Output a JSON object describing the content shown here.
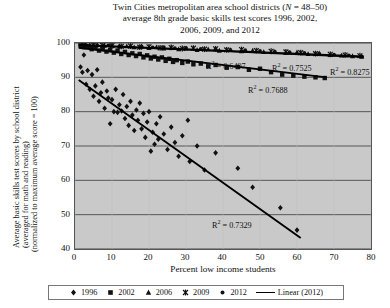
{
  "title": {
    "line1_a": "Twin Cities metropolitan area school districts (",
    "line1_italic": "N",
    "line1_b": " = 48–50)",
    "line2": "average 8th grade basic skills test scores 1996, 2002,",
    "line3": "2006, 2009, and 2012"
  },
  "axes": {
    "y_title_line1": "Average basic skills test scores by school district",
    "y_title_line2": "(averaged for math and reading)",
    "y_title_line3": "(normalized to maximum average score = 100)",
    "x_title": "Percent low income students",
    "y_ticks": [
      "100",
      "90",
      "80",
      "70",
      "60",
      "50",
      "40"
    ],
    "x_ticks": [
      "0",
      "10",
      "20",
      "30",
      "40",
      "50",
      "60",
      "70",
      "80"
    ]
  },
  "annotations": [
    {
      "name": "r2-2006",
      "text_prefix": "R",
      "text_sup": "2",
      "text_suffix": " = 0.6497",
      "value": 0.6497
    },
    {
      "name": "r2-2009",
      "text_prefix": "R",
      "text_sup": "2",
      "text_suffix": " = 0.7525",
      "value": 0.7525
    },
    {
      "name": "r2-2012",
      "text_prefix": "R",
      "text_sup": "2",
      "text_suffix": " = 0.8275",
      "value": 0.8275
    },
    {
      "name": "r2-2002",
      "text_prefix": "R",
      "text_sup": "2",
      "text_suffix": " = 0.7688",
      "value": 0.7688
    },
    {
      "name": "r2-1996",
      "text_prefix": "R",
      "text_sup": "2",
      "text_suffix": " = 0.7329",
      "value": 0.7329
    }
  ],
  "legend": {
    "items": [
      {
        "label": "1996",
        "marker": "diamond"
      },
      {
        "label": "2002",
        "marker": "square"
      },
      {
        "label": "2006",
        "marker": "triangle"
      },
      {
        "label": "2009",
        "marker": "cross"
      },
      {
        "label": "2012",
        "marker": "dot"
      },
      {
        "label": "Linear (2012)",
        "marker": "line"
      }
    ]
  },
  "chart_data": {
    "type": "scatter",
    "xlabel": "Percent low income students",
    "ylabel": "Average basic skills test scores by school district (averaged for math and reading) (normalized to maximum average score = 100)",
    "xlim": [
      0,
      80
    ],
    "ylim": [
      40,
      100
    ],
    "grid": "horizontal",
    "legend_position": "bottom",
    "series": [
      {
        "name": "1996",
        "marker": "diamond",
        "color": "#111111",
        "r_squared": 0.7329,
        "trendline": {
          "x0": 1,
          "y0": 89.2,
          "x1": 61,
          "y1": 43.2
        },
        "points": [
          [
            1.5,
            93.0
          ],
          [
            2.0,
            91.5
          ],
          [
            2.4,
            96.5
          ],
          [
            3.0,
            88.0
          ],
          [
            3.4,
            92.0
          ],
          [
            4.0,
            86.5
          ],
          [
            4.6,
            90.8
          ],
          [
            5.0,
            84.5
          ],
          [
            5.5,
            87.5
          ],
          [
            6.0,
            92.2
          ],
          [
            6.5,
            83.0
          ],
          [
            7.0,
            85.5
          ],
          [
            7.4,
            88.6
          ],
          [
            8.0,
            81.0
          ],
          [
            8.6,
            86.0
          ],
          [
            9.0,
            84.0
          ],
          [
            9.5,
            76.5
          ],
          [
            10.0,
            83.5
          ],
          [
            10.5,
            80.0
          ],
          [
            11.0,
            86.5
          ],
          [
            11.5,
            79.8
          ],
          [
            12.0,
            82.0
          ],
          [
            12.6,
            80.2
          ],
          [
            13.0,
            85.0
          ],
          [
            13.5,
            78.0
          ],
          [
            14.0,
            81.5
          ],
          [
            14.5,
            76.0
          ],
          [
            15.0,
            83.0
          ],
          [
            15.5,
            79.0
          ],
          [
            16.0,
            74.5
          ],
          [
            16.6,
            80.5
          ],
          [
            17.0,
            77.5
          ],
          [
            17.5,
            82.5
          ],
          [
            18.0,
            75.0
          ],
          [
            18.5,
            79.5
          ],
          [
            19.0,
            72.5
          ],
          [
            19.5,
            77.0
          ],
          [
            20.0,
            80.0
          ],
          [
            20.5,
            68.5
          ],
          [
            21.0,
            74.0
          ],
          [
            21.5,
            70.5
          ],
          [
            22.0,
            76.5
          ],
          [
            22.5,
            72.0
          ],
          [
            23.0,
            78.5
          ],
          [
            24.0,
            73.5
          ],
          [
            25.0,
            69.0
          ],
          [
            26.0,
            75.5
          ],
          [
            27.0,
            71.0
          ],
          [
            28.0,
            67.0
          ],
          [
            29.0,
            73.0
          ],
          [
            30.5,
            77.5
          ],
          [
            31.0,
            65.5
          ],
          [
            33.0,
            70.0
          ],
          [
            35.0,
            63.0
          ],
          [
            38.0,
            68.0
          ],
          [
            44.0,
            63.5
          ],
          [
            48.0,
            58.0
          ],
          [
            55.5,
            52.0
          ],
          [
            60.0,
            45.5
          ]
        ]
      },
      {
        "name": "2002",
        "marker": "square",
        "color": "#111111",
        "r_squared": 0.7688,
        "trendline": {
          "x0": 1,
          "y0": 98.6,
          "x1": 68,
          "y1": 90.0
        },
        "points": [
          [
            1.5,
            99.3
          ],
          [
            2.5,
            98.8
          ],
          [
            3.5,
            99.0
          ],
          [
            4.5,
            98.2
          ],
          [
            5.5,
            98.6
          ],
          [
            6.5,
            97.8
          ],
          [
            7.5,
            98.4
          ],
          [
            8.5,
            97.5
          ],
          [
            9.5,
            98.0
          ],
          [
            10.5,
            97.2
          ],
          [
            11.5,
            97.8
          ],
          [
            12.5,
            96.8
          ],
          [
            13.5,
            97.4
          ],
          [
            14.5,
            96.5
          ],
          [
            15.5,
            97.0
          ],
          [
            16.5,
            96.2
          ],
          [
            17.5,
            96.8
          ],
          [
            18.5,
            95.8
          ],
          [
            19.5,
            96.4
          ],
          [
            20.5,
            95.5
          ],
          [
            21.5,
            96.0
          ],
          [
            22.5,
            95.2
          ],
          [
            23.5,
            95.8
          ],
          [
            24.5,
            94.8
          ],
          [
            25.5,
            95.4
          ],
          [
            26.5,
            94.5
          ],
          [
            27.5,
            95.0
          ],
          [
            29.0,
            94.2
          ],
          [
            30.5,
            94.6
          ],
          [
            32.0,
            93.8
          ],
          [
            34.0,
            94.0
          ],
          [
            36.0,
            93.2
          ],
          [
            38.0,
            93.6
          ],
          [
            41.0,
            92.8
          ],
          [
            44.0,
            93.0
          ],
          [
            47.0,
            92.2
          ],
          [
            50.0,
            92.5
          ],
          [
            53.0,
            91.5
          ],
          [
            56.0,
            90.8
          ],
          [
            59.0,
            90.5
          ],
          [
            62.0,
            90.2
          ],
          [
            65.0,
            90.0
          ],
          [
            67.5,
            89.8
          ]
        ]
      },
      {
        "name": "2006",
        "marker": "triangle",
        "color": "#111111",
        "r_squared": 0.6497,
        "trendline": {
          "x0": 1,
          "y0": 99.4,
          "x1": 78,
          "y1": 95.8
        },
        "points": [
          [
            2.0,
            99.6
          ],
          [
            4.0,
            99.4
          ],
          [
            6.0,
            99.5
          ],
          [
            8.0,
            99.2
          ],
          [
            10.0,
            99.3
          ],
          [
            12.0,
            99.0
          ],
          [
            14.0,
            99.1
          ],
          [
            16.0,
            98.8
          ],
          [
            18.0,
            99.0
          ],
          [
            20.0,
            98.6
          ],
          [
            22.0,
            98.8
          ],
          [
            24.0,
            98.4
          ],
          [
            26.0,
            98.6
          ],
          [
            28.0,
            98.2
          ],
          [
            30.0,
            98.4
          ],
          [
            33.0,
            98.0
          ],
          [
            36.0,
            98.2
          ],
          [
            39.0,
            97.8
          ],
          [
            42.0,
            98.0
          ],
          [
            45.0,
            97.6
          ],
          [
            48.0,
            97.8
          ],
          [
            51.0,
            97.4
          ],
          [
            54.0,
            97.5
          ],
          [
            57.0,
            97.2
          ],
          [
            60.0,
            97.3
          ],
          [
            63.0,
            96.8
          ],
          [
            66.0,
            97.0
          ],
          [
            69.0,
            96.5
          ],
          [
            72.0,
            96.4
          ],
          [
            75.0,
            96.2
          ],
          [
            77.5,
            96.0
          ]
        ]
      },
      {
        "name": "2009",
        "marker": "cross",
        "color": "#111111",
        "r_squared": 0.7525,
        "trendline": {
          "x0": 1,
          "y0": 99.5,
          "x1": 78,
          "y1": 96.2
        },
        "points": [
          [
            2.5,
            99.5
          ],
          [
            5.0,
            99.4
          ],
          [
            7.5,
            99.3
          ],
          [
            10.0,
            99.2
          ],
          [
            12.5,
            99.0
          ],
          [
            15.0,
            99.1
          ],
          [
            17.5,
            98.8
          ],
          [
            20.0,
            98.9
          ],
          [
            23.0,
            98.6
          ],
          [
            26.0,
            98.7
          ],
          [
            29.0,
            98.4
          ],
          [
            32.0,
            98.5
          ],
          [
            35.0,
            98.2
          ],
          [
            38.0,
            98.3
          ],
          [
            41.0,
            98.0
          ],
          [
            45.0,
            98.1
          ],
          [
            49.0,
            97.8
          ],
          [
            53.0,
            97.6
          ],
          [
            57.0,
            97.4
          ],
          [
            61.0,
            97.2
          ],
          [
            65.0,
            96.9
          ],
          [
            69.0,
            96.7
          ],
          [
            73.0,
            96.5
          ],
          [
            77.0,
            96.3
          ]
        ]
      },
      {
        "name": "2012",
        "marker": "dot",
        "color": "#111111",
        "r_squared": 0.8275,
        "trendline": {
          "x0": 1,
          "y0": 99.3,
          "x1": 78,
          "y1": 96.0
        },
        "points": [
          [
            3.0,
            99.4
          ],
          [
            6.0,
            99.2
          ],
          [
            9.0,
            99.3
          ],
          [
            12.0,
            99.0
          ],
          [
            15.0,
            98.9
          ],
          [
            18.0,
            99.0
          ],
          [
            21.0,
            98.7
          ],
          [
            24.0,
            98.8
          ],
          [
            27.0,
            98.5
          ],
          [
            30.0,
            98.6
          ],
          [
            34.0,
            98.3
          ],
          [
            38.0,
            98.2
          ],
          [
            42.0,
            98.0
          ],
          [
            46.0,
            97.9
          ],
          [
            50.0,
            97.7
          ],
          [
            54.0,
            97.5
          ],
          [
            58.0,
            97.3
          ],
          [
            62.0,
            97.1
          ],
          [
            66.0,
            96.9
          ],
          [
            70.0,
            96.6
          ],
          [
            74.0,
            96.4
          ],
          [
            77.5,
            96.1
          ]
        ]
      }
    ]
  }
}
